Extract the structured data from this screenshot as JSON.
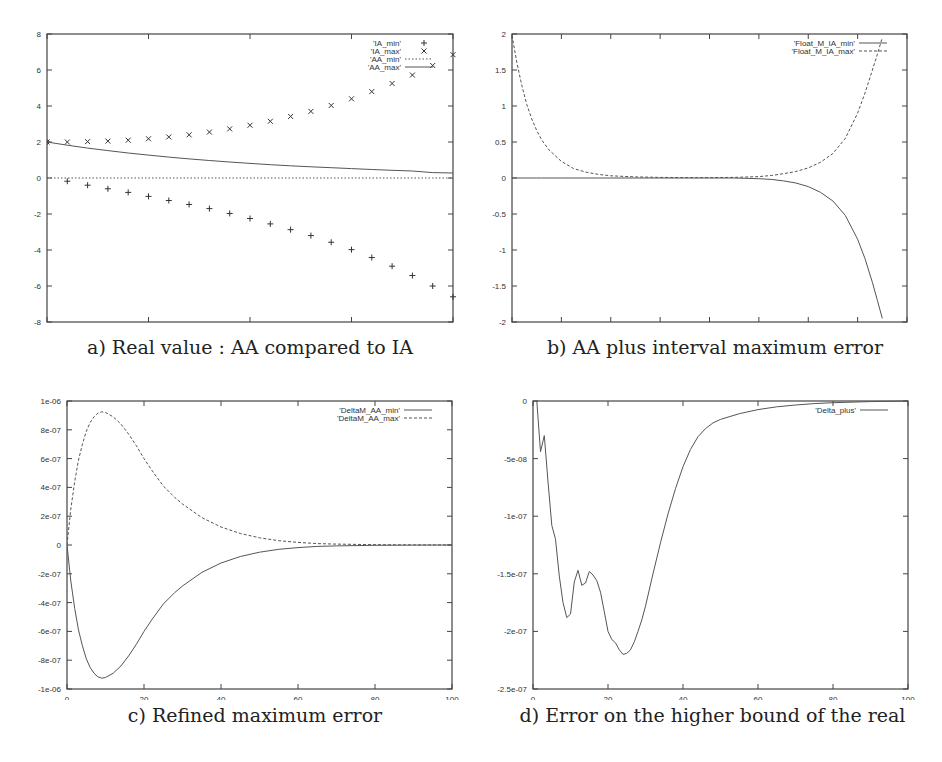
{
  "figure": {
    "panels": [
      {
        "id": "a",
        "caption": "a) Real value : AA compared to IA"
      },
      {
        "id": "b",
        "caption": "b) AA plus interval maximum error"
      },
      {
        "id": "c",
        "caption": "c) Refined maximum error"
      },
      {
        "id": "d",
        "caption": "d) Error on the higher bound of the real"
      }
    ]
  },
  "chart_data": [
    {
      "id": "a",
      "type": "scatter",
      "title": "a) Real value : AA compared to IA",
      "xlabel": "",
      "ylabel": "",
      "xlim": [
        0,
        20
      ],
      "ylim": [
        -8,
        8
      ],
      "xticks": [
        0,
        5,
        10,
        15,
        20
      ],
      "yticks": [
        -8,
        -6,
        -4,
        -2,
        0,
        2,
        4,
        6,
        8
      ],
      "grid": false,
      "legend_position": "top-right",
      "x": [
        0,
        1,
        2,
        3,
        4,
        5,
        6,
        7,
        8,
        9,
        10,
        11,
        12,
        13,
        14,
        15,
        16,
        17,
        18,
        19,
        20
      ],
      "series": [
        {
          "name": "'IA_min'",
          "style": "points-plus",
          "values": [
            2,
            -0.18,
            -0.4,
            -0.6,
            -0.8,
            -1.02,
            -1.25,
            -1.47,
            -1.7,
            -1.97,
            -2.25,
            -2.55,
            -2.87,
            -3.2,
            -3.57,
            -3.98,
            -4.42,
            -4.9,
            -5.42,
            -6.0,
            -6.6
          ]
        },
        {
          "name": "'IA_max'",
          "style": "points-cross",
          "values": [
            2,
            2.0,
            2.02,
            2.05,
            2.1,
            2.18,
            2.28,
            2.4,
            2.55,
            2.73,
            2.93,
            3.15,
            3.42,
            3.7,
            4.03,
            4.4,
            4.8,
            5.25,
            5.72,
            6.25,
            6.85
          ]
        },
        {
          "name": "'AA_min'",
          "style": "dotted-line",
          "values": [
            0,
            0,
            0,
            0,
            0,
            0,
            0,
            0,
            0,
            0,
            0,
            0,
            0,
            0,
            0,
            0,
            0,
            0,
            0,
            0,
            0
          ]
        },
        {
          "name": "'AA_max'",
          "style": "solid-line",
          "values": [
            2,
            1.82,
            1.66,
            1.52,
            1.39,
            1.27,
            1.16,
            1.06,
            0.97,
            0.89,
            0.81,
            0.74,
            0.68,
            0.62,
            0.57,
            0.52,
            0.47,
            0.43,
            0.39,
            0.3,
            0.28
          ]
        }
      ]
    },
    {
      "id": "b",
      "type": "line",
      "title": "b) AA plus interval maximum error",
      "xlabel": "",
      "ylabel": "",
      "xlim": [
        0,
        160
      ],
      "ylim": [
        -2,
        2
      ],
      "xticks": [
        0,
        20,
        40,
        60,
        80,
        100,
        120,
        140,
        160
      ],
      "yticks": [
        -2,
        -1.5,
        -1,
        -0.5,
        0,
        0.5,
        1,
        1.5,
        2
      ],
      "grid": false,
      "legend_position": "top-right",
      "x": [
        0,
        2,
        4,
        6,
        8,
        10,
        12,
        15,
        20,
        25,
        30,
        35,
        40,
        50,
        60,
        70,
        80,
        90,
        100,
        105,
        110,
        115,
        120,
        125,
        130,
        135,
        140,
        143,
        146,
        148,
        150
      ],
      "series": [
        {
          "name": "'Float_M_IA_min'",
          "style": "solid-line",
          "values": [
            0,
            0,
            0,
            0,
            0,
            0,
            0,
            0,
            0,
            0,
            0,
            0,
            0,
            0,
            0,
            0,
            0,
            0,
            -0.01,
            -0.02,
            -0.04,
            -0.07,
            -0.12,
            -0.2,
            -0.32,
            -0.52,
            -0.85,
            -1.12,
            -1.45,
            -1.7,
            -1.95
          ]
        },
        {
          "name": "'Float_M_IA_max'",
          "style": "dashed-line",
          "values": [
            1.98,
            1.6,
            1.28,
            1.02,
            0.82,
            0.66,
            0.53,
            0.39,
            0.23,
            0.13,
            0.08,
            0.05,
            0.03,
            0.015,
            0.008,
            0.005,
            0.005,
            0.008,
            0.02,
            0.035,
            0.06,
            0.09,
            0.14,
            0.22,
            0.34,
            0.55,
            0.9,
            1.18,
            1.5,
            1.72,
            1.95
          ]
        }
      ]
    },
    {
      "id": "c",
      "type": "line",
      "title": "c) Refined maximum error",
      "xlabel": "",
      "ylabel": "",
      "xlim": [
        0,
        100
      ],
      "ylim": [
        -1e-06,
        1e-06
      ],
      "xticks": [
        0,
        20,
        40,
        60,
        80,
        100
      ],
      "yticks": [
        "-1e-06",
        "-8e-07",
        "-6e-07",
        "-4e-07",
        "-2e-07",
        "0",
        "2e-07",
        "4e-07",
        "6e-07",
        "8e-07",
        "1e-06"
      ],
      "grid": false,
      "legend_position": "top-right",
      "x": [
        0,
        1,
        2,
        3,
        4,
        5,
        6,
        7,
        8,
        9,
        10,
        12,
        14,
        16,
        18,
        20,
        22,
        25,
        28,
        30,
        35,
        40,
        45,
        50,
        55,
        60,
        65,
        70,
        80,
        90,
        100
      ],
      "series": [
        {
          "name": "'DeltaM_AA_min'",
          "style": "solid-line",
          "values": [
            0,
            -2.5e-07,
            -4.4e-07,
            -5.9e-07,
            -7e-07,
            -7.9e-07,
            -8.5e-07,
            -8.9e-07,
            -9.15e-07,
            -9.25e-07,
            -9.2e-07,
            -8.9e-07,
            -8.4e-07,
            -7.7e-07,
            -6.9e-07,
            -6e-07,
            -5.2e-07,
            -4.1e-07,
            -3.3e-07,
            -2.85e-07,
            -1.9e-07,
            -1.25e-07,
            -8e-08,
            -5e-08,
            -3e-08,
            -1.8e-08,
            -1e-08,
            -6e-09,
            -2e-09,
            -5e-10,
            0
          ]
        },
        {
          "name": "'DeltaM_AA_max'",
          "style": "dashed-line",
          "values": [
            0,
            2.5e-07,
            4.4e-07,
            5.9e-07,
            7e-07,
            7.9e-07,
            8.5e-07,
            8.9e-07,
            9.15e-07,
            9.25e-07,
            9.2e-07,
            8.9e-07,
            8.4e-07,
            7.7e-07,
            6.9e-07,
            6e-07,
            5.2e-07,
            4.1e-07,
            3.3e-07,
            2.85e-07,
            1.9e-07,
            1.25e-07,
            8e-08,
            5e-08,
            3e-08,
            1.8e-08,
            1e-08,
            6e-09,
            2e-09,
            5e-10,
            0
          ]
        }
      ]
    },
    {
      "id": "d",
      "type": "line",
      "title": "d) Error on the higher bound of the real",
      "xlabel": "",
      "ylabel": "",
      "xlim": [
        0,
        100
      ],
      "ylim": [
        -2.5e-07,
        0
      ],
      "xticks": [
        0,
        20,
        40,
        60,
        80,
        100
      ],
      "yticks": [
        "-2.5e-07",
        "-2e-07",
        "-1.5e-07",
        "-1e-07",
        "-5e-08",
        "0"
      ],
      "grid": false,
      "legend_position": "top-right",
      "x": [
        1,
        2,
        3,
        4,
        5,
        6,
        7,
        8,
        9,
        10,
        11,
        12,
        13,
        14,
        15,
        16,
        17,
        18,
        19,
        20,
        21,
        22,
        23,
        24,
        25,
        26,
        27,
        28,
        29,
        30,
        32,
        34,
        36,
        38,
        40,
        42,
        44,
        46,
        48,
        50,
        55,
        60,
        65,
        70,
        75,
        80,
        90,
        100
      ],
      "series": [
        {
          "name": "'Delta_plus'",
          "style": "solid-line",
          "values": [
            0,
            -4.4e-08,
            -3e-08,
            -7e-08,
            -1.08e-07,
            -1.2e-07,
            -1.52e-07,
            -1.75e-07,
            -1.88e-07,
            -1.85e-07,
            -1.57e-07,
            -1.47e-07,
            -1.6e-07,
            -1.58e-07,
            -1.48e-07,
            -1.51e-07,
            -1.56e-07,
            -1.66e-07,
            -1.83e-07,
            -2e-07,
            -2.07e-07,
            -2.1e-07,
            -2.16e-07,
            -2.2e-07,
            -2.19e-07,
            -2.16e-07,
            -2.09e-07,
            -2e-07,
            -1.9e-07,
            -1.78e-07,
            -1.5e-07,
            -1.23e-07,
            -9.8e-08,
            -7.6e-08,
            -5.7e-08,
            -4.2e-08,
            -3.1e-08,
            -2.4e-08,
            -1.9e-08,
            -1.6e-08,
            -1.1e-08,
            -7.5e-09,
            -5e-09,
            -3.5e-09,
            -2.3e-09,
            -1.5e-09,
            -5e-10,
            0
          ]
        }
      ]
    }
  ]
}
